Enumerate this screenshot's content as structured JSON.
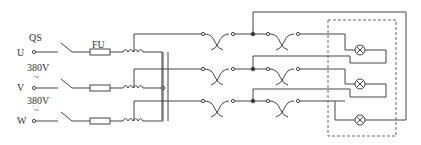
{
  "diagram": {
    "labels": {
      "switch": "QS",
      "fuse": "FU",
      "phase_u": "U",
      "phase_v": "V",
      "phase_w": "W",
      "voltage_uv": "380V",
      "voltage_vw": "380V",
      "ac_symbol_1": "~",
      "ac_symbol_2": "~"
    },
    "phases": [
      {
        "name": "U",
        "y": 51
      },
      {
        "name": "V",
        "y": 87
      },
      {
        "name": "W",
        "y": 120
      }
    ],
    "components": {
      "switch": "three-pole knife switch",
      "fuses": 3,
      "coils": 3,
      "couplers": 6,
      "lamps": 3,
      "lamp_enclosure": "dashed box"
    },
    "colors": {
      "line": "#444444",
      "dash": "#666666",
      "background": "#ffffff"
    }
  }
}
